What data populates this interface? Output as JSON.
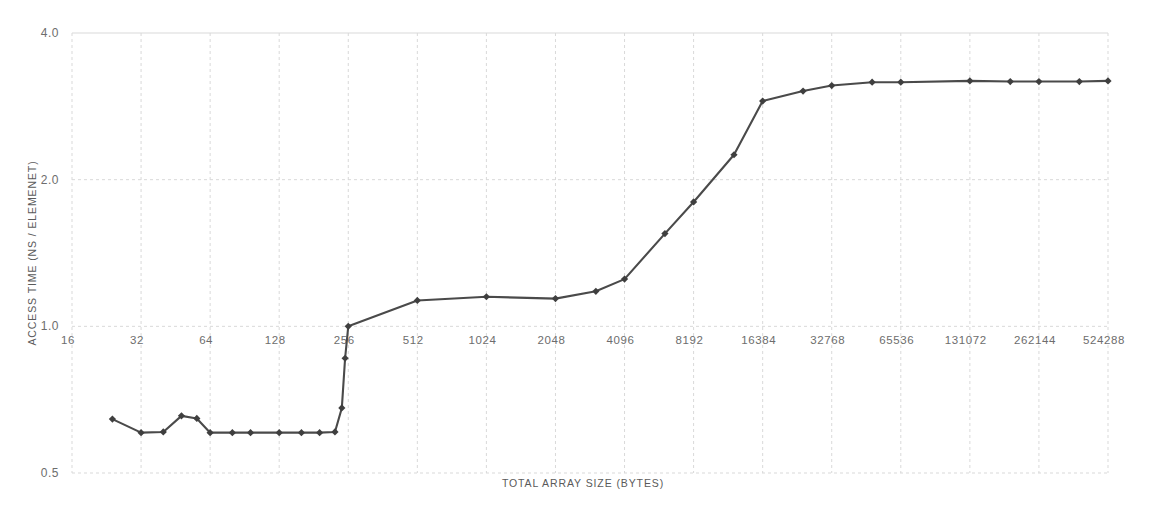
{
  "chart_data": {
    "type": "line",
    "title": "",
    "xlabel": "TOTAL ARRAY SIZE (BYTES)",
    "ylabel": "ACCESS TIME (NS / ELEMENET)",
    "xscale": "log2",
    "yscale": "log2",
    "xlim": [
      16,
      524288
    ],
    "ylim": [
      0.5,
      4.0
    ],
    "grid": true,
    "legend": null,
    "x_tick_labels": [
      "16",
      "32",
      "64",
      "128",
      "256",
      "512",
      "1024",
      "2048",
      "4096",
      "8192",
      "16384",
      "32768",
      "65536",
      "131072",
      "262144",
      "524288"
    ],
    "x_tick_values": [
      16,
      32,
      64,
      128,
      256,
      512,
      1024,
      2048,
      4096,
      8192,
      16384,
      32768,
      65536,
      131072,
      262144,
      524288
    ],
    "y_tick_labels": [
      "4.0",
      "2.0",
      "1.0",
      "0.5"
    ],
    "y_tick_values": [
      4.0,
      2.0,
      1.0,
      0.5
    ],
    "series": [
      {
        "name": "access time",
        "marker": "diamond",
        "color": "#434343",
        "points": [
          {
            "x": 24,
            "y": 0.645
          },
          {
            "x": 32,
            "y": 0.605
          },
          {
            "x": 40,
            "y": 0.607
          },
          {
            "x": 48,
            "y": 0.655
          },
          {
            "x": 56,
            "y": 0.647
          },
          {
            "x": 64,
            "y": 0.605
          },
          {
            "x": 80,
            "y": 0.605
          },
          {
            "x": 96,
            "y": 0.605
          },
          {
            "x": 128,
            "y": 0.605
          },
          {
            "x": 160,
            "y": 0.605
          },
          {
            "x": 192,
            "y": 0.605
          },
          {
            "x": 224,
            "y": 0.607
          },
          {
            "x": 240,
            "y": 0.68
          },
          {
            "x": 248,
            "y": 0.86
          },
          {
            "x": 256,
            "y": 1.0
          },
          {
            "x": 512,
            "y": 1.13
          },
          {
            "x": 1024,
            "y": 1.15
          },
          {
            "x": 2048,
            "y": 1.14
          },
          {
            "x": 3072,
            "y": 1.18
          },
          {
            "x": 4096,
            "y": 1.25
          },
          {
            "x": 6144,
            "y": 1.55
          },
          {
            "x": 8192,
            "y": 1.8
          },
          {
            "x": 12288,
            "y": 2.25
          },
          {
            "x": 16384,
            "y": 2.9
          },
          {
            "x": 24576,
            "y": 3.04
          },
          {
            "x": 32768,
            "y": 3.12
          },
          {
            "x": 49152,
            "y": 3.17
          },
          {
            "x": 65536,
            "y": 3.17
          },
          {
            "x": 131072,
            "y": 3.19
          },
          {
            "x": 196608,
            "y": 3.18
          },
          {
            "x": 262144,
            "y": 3.18
          },
          {
            "x": 393216,
            "y": 3.18
          },
          {
            "x": 524288,
            "y": 3.19
          }
        ]
      }
    ],
    "colors": {
      "line": "#4a4a4a",
      "marker": "#3f3f3f",
      "grid": "#d9d9d9",
      "text": "#6d6d6d",
      "background": "#ffffff"
    }
  }
}
